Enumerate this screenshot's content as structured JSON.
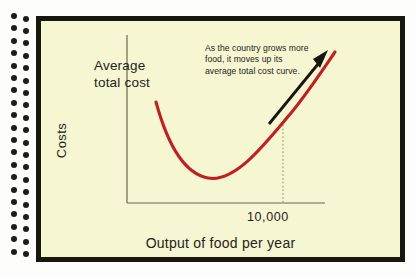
{
  "chart_data": {
    "type": "line",
    "title": "",
    "xlabel": "Output of food per year",
    "ylabel": "Costs",
    "series": [
      {
        "name": "Average total cost",
        "points": [
          {
            "x": 30,
            "y": 101
          },
          {
            "x": 40,
            "y": 74
          },
          {
            "x": 50,
            "y": 54
          },
          {
            "x": 60,
            "y": 39
          },
          {
            "x": 70,
            "y": 29
          },
          {
            "x": 80,
            "y": 25
          },
          {
            "x": 90,
            "y": 26
          },
          {
            "x": 100,
            "y": 33
          },
          {
            "x": 110,
            "y": 45
          },
          {
            "x": 120,
            "y": 61
          },
          {
            "x": 130,
            "y": 80
          },
          {
            "x": 140,
            "y": 101
          },
          {
            "x": 150,
            "y": 124
          }
        ]
      }
    ],
    "xticks": [
      "10,000"
    ],
    "xtick_positions": [
      103
    ],
    "yticks": [],
    "grid": false,
    "legend": "none",
    "annotations": [
      {
        "text": "As the country grows more food, it moves up its average total cost curve.",
        "type": "callout-with-arrow"
      },
      {
        "text": "Average total cost",
        "type": "curve-label"
      }
    ],
    "guide_lines": [
      {
        "type": "vertical-dotted",
        "at_x": 103,
        "label": "10,000"
      }
    ],
    "curve_color": "#C0201F",
    "arrow_color": "#16160E",
    "axis_color": "#6B6A4E"
  },
  "figure": {
    "curve_label": "Average\ntotal cost",
    "annotation": "As the country grows more\nfood, it moves up its\naverage total cost curve.",
    "y_axis_title": "Costs",
    "x_axis_title": "Output of food per year",
    "x_tick_label": "10,000"
  },
  "colors": {
    "page_background": "#F7F6D2",
    "frame": "#17170F",
    "outer_background": "#FDFDFB",
    "curve": "#C0201F",
    "text": "#23231A",
    "binding_dot": "#1C1C1A"
  }
}
